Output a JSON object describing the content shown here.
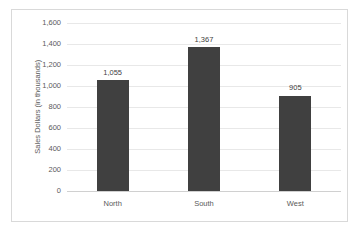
{
  "chart_data": {
    "type": "bar",
    "title": "",
    "xlabel": "",
    "ylabel": "Sales Dollars (in thousands)",
    "categories": [
      "North",
      "South",
      "West"
    ],
    "values": [
      1055,
      1367,
      905
    ],
    "value_labels": [
      "1,055",
      "1,367",
      "905"
    ],
    "ylim": [
      0,
      1600
    ],
    "yticks": [
      0,
      200,
      400,
      600,
      800,
      1000,
      1200,
      1400,
      1600
    ],
    "ytick_labels": [
      "0",
      "200",
      "400",
      "600",
      "800",
      "1,000",
      "1,200",
      "1,400",
      "1,600"
    ],
    "grid": true,
    "legend": false,
    "series": [
      {
        "name": "Sales Dollars",
        "values": [
          1055,
          1367,
          905
        ],
        "color": "#404040"
      }
    ],
    "colors": {
      "bar": "#404040",
      "gridline": "#e8e8e8",
      "baseline": "#d0d0d0",
      "border": "#d9d9d9",
      "background": "#ffffff",
      "tick_text": "#5a5a5a",
      "value_text": "#3f3f3f"
    }
  }
}
